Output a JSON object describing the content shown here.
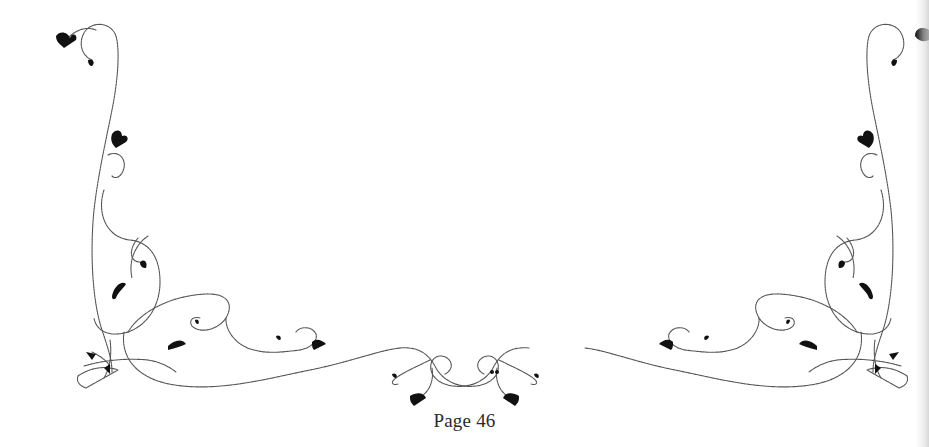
{
  "page": {
    "page_number_label": "Page 46",
    "background_color": "#ffffff",
    "ornament_color": "#111111"
  },
  "ornament": {
    "type": "decorative-floral-border",
    "sections": [
      "top-left-corner",
      "left-vine",
      "bottom-left-swirl",
      "bottom-center-knot",
      "bottom-right-swirl",
      "right-vine",
      "top-right-corner"
    ]
  }
}
